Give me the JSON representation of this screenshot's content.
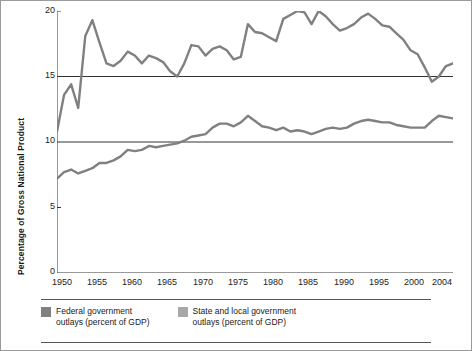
{
  "chart_data": {
    "type": "line",
    "title": "",
    "xlabel": "",
    "ylabel": "Percentage of Gross National Product",
    "ylim": [
      0,
      20
    ],
    "xlim": [
      1948,
      2004
    ],
    "yticks": [
      0,
      5,
      10,
      15,
      20
    ],
    "xticks": [
      1950,
      1955,
      1960,
      1965,
      1970,
      1975,
      1980,
      1985,
      1990,
      1995,
      2000,
      2004
    ],
    "grid": "horizontal-at-10-and-15",
    "legend_position": "bottom",
    "series": [
      {
        "name": "Federal government outlays (percent of GDP)",
        "color": "#808080",
        "x": [
          1948,
          1949,
          1950,
          1951,
          1952,
          1953,
          1954,
          1955,
          1956,
          1957,
          1958,
          1959,
          1960,
          1961,
          1962,
          1963,
          1964,
          1965,
          1966,
          1967,
          1968,
          1969,
          1970,
          1971,
          1972,
          1973,
          1974,
          1975,
          1976,
          1977,
          1978,
          1979,
          1980,
          1981,
          1982,
          1983,
          1984,
          1985,
          1986,
          1987,
          1988,
          1989,
          1990,
          1991,
          1992,
          1993,
          1994,
          1995,
          1996,
          1997,
          1998,
          1999,
          2000,
          2001,
          2002,
          2003,
          2004
        ],
        "values": [
          10.8,
          13.6,
          14.4,
          12.6,
          18.1,
          19.3,
          17.6,
          16.0,
          15.8,
          16.2,
          16.9,
          16.6,
          16.0,
          16.6,
          16.4,
          16.1,
          15.4,
          15.0,
          16.0,
          17.4,
          17.3,
          16.6,
          17.1,
          17.3,
          17.0,
          16.3,
          16.5,
          19.0,
          18.4,
          18.3,
          18.0,
          17.7,
          19.4,
          19.7,
          20.0,
          19.9,
          19.0,
          20.0,
          19.6,
          19.0,
          18.5,
          18.7,
          19.0,
          19.5,
          19.8,
          19.4,
          18.9,
          18.8,
          18.3,
          17.8,
          17.0,
          16.7,
          15.7,
          14.6,
          15.0,
          15.8,
          16.0
        ]
      },
      {
        "name": "State and local government outlays (percent of GDP)",
        "color": "#808080",
        "x": [
          1948,
          1949,
          1950,
          1951,
          1952,
          1953,
          1954,
          1955,
          1956,
          1957,
          1958,
          1959,
          1960,
          1961,
          1962,
          1963,
          1964,
          1965,
          1966,
          1967,
          1968,
          1969,
          1970,
          1971,
          1972,
          1973,
          1974,
          1975,
          1976,
          1977,
          1978,
          1979,
          1980,
          1981,
          1982,
          1983,
          1984,
          1985,
          1986,
          1987,
          1988,
          1989,
          1990,
          1991,
          1992,
          1993,
          1994,
          1995,
          1996,
          1997,
          1998,
          1999,
          2000,
          2001,
          2002,
          2003,
          2004
        ],
        "values": [
          7.2,
          7.7,
          7.9,
          7.6,
          7.8,
          8.0,
          8.4,
          8.4,
          8.6,
          8.9,
          9.4,
          9.3,
          9.4,
          9.7,
          9.6,
          9.7,
          9.8,
          9.9,
          10.1,
          10.4,
          10.5,
          10.6,
          11.1,
          11.4,
          11.4,
          11.2,
          11.5,
          12.0,
          11.6,
          11.2,
          11.1,
          10.9,
          11.1,
          10.8,
          10.9,
          10.8,
          10.6,
          10.8,
          11.0,
          11.1,
          11.0,
          11.1,
          11.4,
          11.6,
          11.7,
          11.6,
          11.5,
          11.5,
          11.3,
          11.2,
          11.1,
          11.1,
          11.1,
          11.6,
          12.0,
          11.9,
          11.8
        ]
      }
    ],
    "legend": [
      {
        "label_line1": "Federal government",
        "label_line2": "outlays (percent of GDP)",
        "color": "#808080"
      },
      {
        "label_line1": "State and local government",
        "label_line2": "outlays (percent of GDP)",
        "color": "#a8a8a8"
      }
    ]
  }
}
